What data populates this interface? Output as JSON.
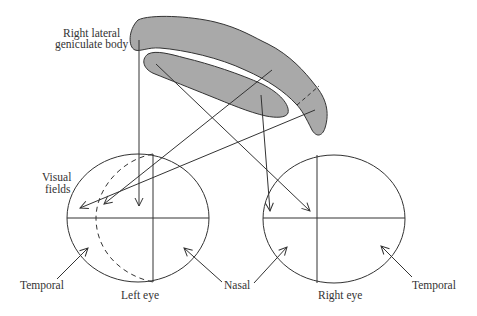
{
  "diagram": {
    "labels": {
      "lgn": [
        "Right lateral",
        "geniculate body"
      ],
      "visual_fields": [
        "Visual",
        "fields"
      ],
      "temporal_left": "Temporal",
      "left_eye": "Left eye",
      "nasal": "Nasal",
      "right_eye": "Right eye",
      "temporal_right": "Temporal"
    },
    "colors": {
      "lgn_fill": "#a9a9a9",
      "stroke": "#333333",
      "background": "#ffffff"
    }
  }
}
